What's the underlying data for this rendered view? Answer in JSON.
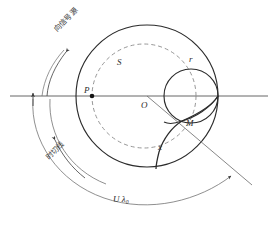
{
  "figure": {
    "type": "geometry-diagram",
    "title": "",
    "background_color": "#ffffff",
    "stroke_color": "#2b2b2b",
    "dashed_color": "#8a8a8a",
    "axis_color": "#555555"
  },
  "labels": {
    "point_S": "S",
    "point_P": "P",
    "point_O": "O",
    "point_M": "M",
    "radius_r": "r",
    "distance_x": "x",
    "arc_bottom": "U λ₀",
    "arc_top_cjk": "向信号源",
    "arc_mid_cjk": "时切线"
  },
  "geometry": {
    "origin": {
      "x": 147,
      "y": 96,
      "label": "O"
    },
    "big_circle": {
      "cx": 147,
      "cy": 96,
      "r": 71,
      "style": "solid"
    },
    "dashed_circle": {
      "cx": 144,
      "cy": 96,
      "r": 52,
      "style": "dashed"
    },
    "small_circle": {
      "cx": 191,
      "cy": 96,
      "r": 27,
      "style": "solid"
    },
    "point_P": {
      "x": 92,
      "y": 96
    },
    "point_M": {
      "x": 181,
      "y": 122
    },
    "point_S": {
      "x": 122,
      "y": 62
    },
    "axis": {
      "x1": 10,
      "y1": 96,
      "x2": 268,
      "y2": 96
    },
    "diagonal": {
      "x1": 147,
      "y1": 96,
      "x2": 252,
      "y2": 185
    }
  },
  "arrows": {
    "axis_up_arrow": {
      "x": 33,
      "y": 96,
      "direction": "up"
    },
    "outer_arc_arrow": {
      "x": 63,
      "y": 48,
      "direction": "up-right"
    },
    "mid_arc_arrow": {
      "x": 62,
      "y": 145,
      "direction": "down-right"
    },
    "bottom_arc_arrow": {
      "x": 232,
      "y": 177,
      "direction": "up-right"
    }
  }
}
